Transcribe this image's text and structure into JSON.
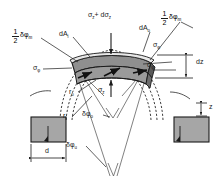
{
  "figure": {
    "type": "engineering-stress-diagram",
    "background_color": "#ffffff",
    "line_color": "#1a1a1a",
    "shaded_fill": "#999999",
    "block_fill": "#a6a6a6"
  },
  "labels": {
    "dA_inner": {
      "text": "dA",
      "sub": "i"
    },
    "dA_outer": {
      "text": "dA",
      "sub": "o"
    },
    "sigma_z_plus_dsigma_z": {
      "text": "σ",
      "sub1": "z",
      "plus": "+ dσ",
      "sub2": "z"
    },
    "sigma_z": {
      "text": "σ",
      "sub": "z"
    },
    "sigma_phi_left": {
      "text": "σ",
      "sub": "φ"
    },
    "sigma_phi_right": {
      "text": "σ",
      "sub": "φ"
    },
    "sigma_phi_right_upper": {
      "text": "σ",
      "sub": "φ"
    },
    "half_delta_phi_m_left": {
      "num": "1",
      "den": "2",
      "text": "δφ",
      "sub": "m"
    },
    "half_delta_phi_m_right": {
      "num": "1",
      "den": "2",
      "text": "δφ",
      "sub": "m"
    },
    "dz": {
      "text": "dz"
    },
    "z": {
      "text": "z"
    },
    "d": {
      "text": "d"
    },
    "r_outer": {
      "text": "r",
      "sub": "o"
    },
    "r_inner": {
      "text": "r",
      "sub": "i"
    },
    "delta_phi_outer": {
      "text": "δφ",
      "sub": "o"
    },
    "delta_phi_inner": {
      "text": "δφ",
      "sub": "u"
    }
  },
  "geometry": {
    "arch_span_left_block_x": 55,
    "arch_span_right_block_x": 190,
    "apex_y": 48,
    "element_width": 80,
    "element_height": 26
  }
}
